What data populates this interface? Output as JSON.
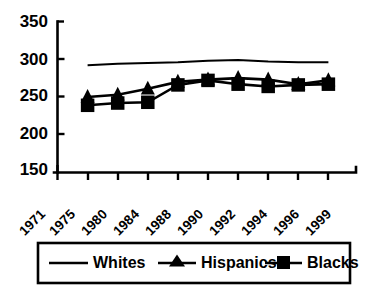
{
  "chart_data": {
    "type": "line",
    "title": "",
    "subtitle": "",
    "xlabel": "",
    "ylabel": "",
    "categories": [
      "1971",
      "1975",
      "1980",
      "1984",
      "1988",
      "1990",
      "1992",
      "1994",
      "1996",
      "1999"
    ],
    "xtick_labels": [
      "1971",
      "1975",
      "1980",
      "1984",
      "1988",
      "1990",
      "1992",
      "1994",
      "1996",
      "1999"
    ],
    "ytick_labels": [
      "150",
      "200",
      "250",
      "300",
      "350"
    ],
    "ytick_values": [
      150,
      200,
      250,
      300,
      350
    ],
    "ylim": [
      150,
      350
    ],
    "grid": false,
    "legend_position": "bottom",
    "series": [
      {
        "name": "Whites",
        "marker": "none",
        "color": "#000000",
        "x": [
          "1975",
          "1980",
          "1984",
          "1988",
          "1990",
          "1992",
          "1994",
          "1996",
          "1999"
        ],
        "values": [
          292,
          294,
          295,
          296,
          298,
          299,
          297,
          296,
          296
        ]
      },
      {
        "name": "Hispanics",
        "marker": "triangle",
        "color": "#000000",
        "x": [
          "1975",
          "1980",
          "1984",
          "1988",
          "1990",
          "1992",
          "1994",
          "1996",
          "1999"
        ],
        "values": [
          250,
          253,
          261,
          270,
          273,
          275,
          273,
          267,
          272
        ]
      },
      {
        "name": "Blacks",
        "marker": "square",
        "color": "#000000",
        "x": [
          "1975",
          "1980",
          "1984",
          "1988",
          "1990",
          "1992",
          "1994",
          "1996",
          "1999"
        ],
        "values": [
          239,
          242,
          243,
          266,
          272,
          267,
          264,
          266,
          267
        ]
      }
    ]
  },
  "legend": {
    "entries": [
      {
        "label": "Whites",
        "marker": "none"
      },
      {
        "label": "Hispanics",
        "marker": "triangle"
      },
      {
        "label": "Blacks",
        "marker": "square"
      }
    ]
  },
  "axes": {
    "y_min_label": "150",
    "y_max_label": "350"
  }
}
